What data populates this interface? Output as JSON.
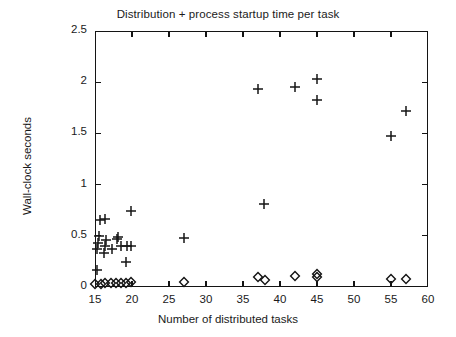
{
  "chart_data": {
    "type": "scatter",
    "title": "Distribution + process startup time per task",
    "xlabel": "Number of distributed tasks",
    "ylabel": "Wall-clock seconds",
    "xlim": [
      15,
      60
    ],
    "ylim": [
      0,
      2.5
    ],
    "xticks": [
      15,
      20,
      25,
      30,
      35,
      40,
      45,
      50,
      55,
      60
    ],
    "xticklabels": [
      "15",
      "20",
      "25",
      "30",
      "35",
      "40",
      "45",
      "50",
      "55",
      "60"
    ],
    "yticks": [
      0,
      0.5,
      1,
      1.5,
      2,
      2.5
    ],
    "yticklabels": [
      "0",
      "0.5",
      "1",
      "1.5",
      "2",
      "2.5"
    ],
    "grid": false,
    "legend": false,
    "series": [
      {
        "name": "plus",
        "marker": "plus",
        "color": "#141414",
        "points": [
          [
            15.3,
            0.17
          ],
          [
            15.3,
            0.37
          ],
          [
            15.4,
            0.43
          ],
          [
            15.5,
            0.5
          ],
          [
            15.7,
            0.65
          ],
          [
            16.3,
            0.66
          ],
          [
            16.2,
            0.33
          ],
          [
            16.4,
            0.4
          ],
          [
            16.5,
            0.46
          ],
          [
            17.3,
            0.37
          ],
          [
            18.0,
            0.47
          ],
          [
            18.1,
            0.49
          ],
          [
            18.5,
            0.4
          ],
          [
            19.3,
            0.4
          ],
          [
            19.2,
            0.24
          ],
          [
            19.9,
            0.4
          ],
          [
            19.8,
            0.74
          ],
          [
            27.0,
            0.48
          ],
          [
            37.9,
            0.81
          ],
          [
            37.0,
            1.93
          ],
          [
            42.0,
            1.95
          ],
          [
            45.0,
            2.03
          ],
          [
            45.0,
            1.83
          ],
          [
            55.0,
            1.47
          ],
          [
            57.0,
            1.72
          ]
        ]
      },
      {
        "name": "diamond",
        "marker": "diamond",
        "color": "#141414",
        "points": [
          [
            15.0,
            0.03
          ],
          [
            15.8,
            0.03
          ],
          [
            16.4,
            0.04
          ],
          [
            17.1,
            0.04
          ],
          [
            17.8,
            0.04
          ],
          [
            18.5,
            0.04
          ],
          [
            19.2,
            0.04
          ],
          [
            19.9,
            0.05
          ],
          [
            27.0,
            0.05
          ],
          [
            37.0,
            0.1
          ],
          [
            38.0,
            0.07
          ],
          [
            42.0,
            0.11
          ],
          [
            45.0,
            0.13
          ],
          [
            45.0,
            0.1
          ],
          [
            55.0,
            0.08
          ],
          [
            57.0,
            0.08
          ]
        ]
      }
    ]
  }
}
